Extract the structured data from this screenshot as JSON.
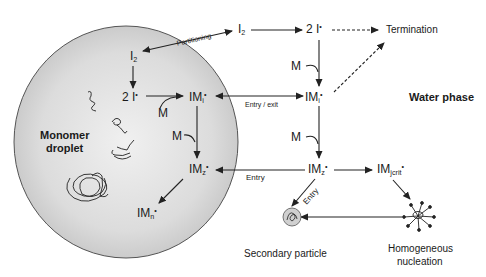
{
  "diagram": {
    "regions": {
      "droplet_label_line1": "Monomer",
      "droplet_label_line2": "droplet",
      "water_label": "Water phase"
    },
    "water_nodes": {
      "i2": {
        "base": "I",
        "sub": "2",
        "sup": ""
      },
      "two_i": {
        "base": "2 I",
        "sub": "",
        "sup": "•"
      },
      "termination": "Termination",
      "imi": {
        "base": "IM",
        "sub": "i",
        "sup": "•"
      },
      "imz": {
        "base": "IM",
        "sub": "z",
        "sup": "•"
      },
      "imjcrit": {
        "base": "IM",
        "sub": "jcrit",
        "sup": "•"
      },
      "secondary_particle": "Secondary particle",
      "homogeneous_line1": "Homogeneous",
      "homogeneous_line2": "nucleation"
    },
    "droplet_nodes": {
      "i2": {
        "base": "I",
        "sub": "2",
        "sup": ""
      },
      "two_i": {
        "base": "2 I",
        "sub": "",
        "sup": "•"
      },
      "imi": {
        "base": "IM",
        "sub": "i",
        "sup": "•"
      },
      "imz": {
        "base": "IM",
        "sub": "z",
        "sup": "•"
      },
      "imn": {
        "base": "IM",
        "sub": "n",
        "sup": "•"
      }
    },
    "monomer_labels": {
      "droplet_m1": "M",
      "droplet_m2": "M",
      "water_m1": "M",
      "water_m2": "M"
    },
    "edge_labels": {
      "partitioning": "Partitioning",
      "entry_exit": "Entry / exit",
      "entry_droplet": "Entry",
      "entry_secondary": "Entry"
    },
    "colors": {
      "droplet_fill_light": "#f2f2f2",
      "droplet_fill_dark": "#c8c8c8",
      "droplet_stroke": "#555555",
      "arrow": "#222222"
    }
  }
}
